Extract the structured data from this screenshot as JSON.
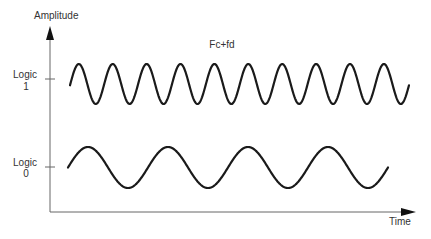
{
  "chart_data": {
    "type": "line",
    "title": "",
    "annotation": "Fc+fd",
    "xlabel": "Time",
    "ylabel": "Amplitude",
    "y_tick_labels": [
      {
        "line1": "Logic",
        "line2": "1"
      },
      {
        "line1": "Logic",
        "line2": "0"
      }
    ],
    "grid": false,
    "legend": "none",
    "series": [
      {
        "name": "Logic 1 (Fc+fd)",
        "description": "higher-frequency sinusoid",
        "cycles": 9.75,
        "level": "Logic 1"
      },
      {
        "name": "Logic 0 (Fc)",
        "description": "lower-frequency sinusoid",
        "cycles": 4.25,
        "level": "Logic 0"
      }
    ]
  },
  "labels": {
    "amplitude": "Amplitude",
    "time": "Time",
    "freq": "Fc+fd",
    "logic1_line1": "Logic",
    "logic1_line2": "1",
    "logic0_line1": "Logic",
    "logic0_line2": "0"
  },
  "colors": {
    "wave": "#1a1a1a",
    "axis": "#555555",
    "text": "#333333"
  }
}
